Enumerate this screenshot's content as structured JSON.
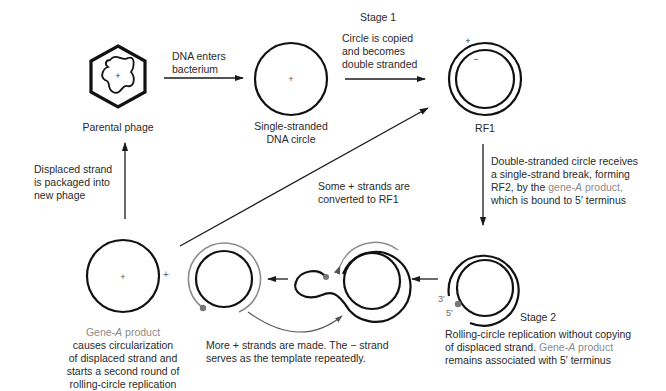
{
  "stage1": "Stage 1",
  "stage2": "Stage 2",
  "nodes": {
    "parental_phage": "Parental phage",
    "ss_circle": [
      "Single-stranded",
      "DNA circle"
    ],
    "rf1": "RF1"
  },
  "steps": {
    "dna_enters": [
      "DNA enters",
      "bacterium"
    ],
    "copied": [
      "Circle is copied",
      "and becomes",
      "double stranded"
    ],
    "rf2": {
      "line1": "Double-stranded circle receives",
      "line2": "a single-strand break, forming",
      "line3_pre": "RF2, by the ",
      "line3_gene": "gene-",
      "line3_a": "A",
      "line3_product": " product,",
      "line4": "which is bound to 5′ terminus"
    },
    "rolling": {
      "line1": "Rolling-circle replication without copying",
      "line2_pre": "of displaced strand. ",
      "line2_gene": "Gene-",
      "line2_a": "A",
      "line2_product": " product",
      "line3": "remains associated with 5′ terminus"
    },
    "more_strands": [
      "More + strands are made. The − strand",
      "serves as the template repeatedly."
    ],
    "some_converted": [
      "Some + strands are",
      "converted to RF1"
    ],
    "packaged": [
      "Displaced strand",
      "is packaged into",
      "new phage"
    ],
    "circularization": {
      "gene": "Gene-",
      "a": "A",
      "product": " product",
      "lines": [
        "causes circularization",
        "of displaced strand and",
        "starts a second round of",
        "rolling-circle replication"
      ]
    }
  },
  "strand_labels": {
    "plus": "+",
    "minus": "−",
    "three_prime": "3′",
    "five_prime": "5′"
  },
  "colors": {
    "stroke": "#1a1a1a",
    "gray_strand": "#8c8c8c",
    "gray_text": "#8a8a8a"
  }
}
